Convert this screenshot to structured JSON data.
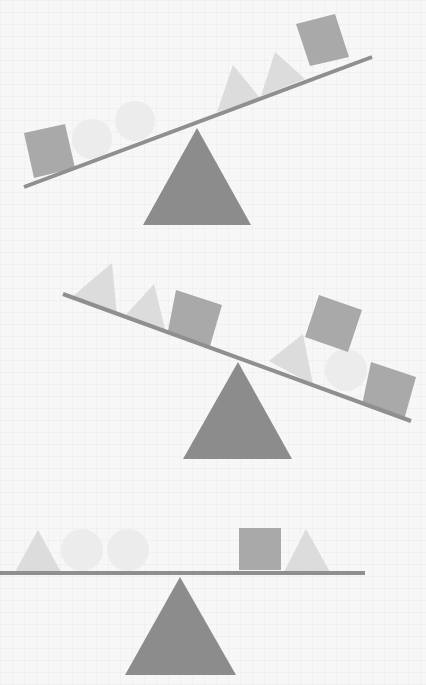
{
  "colors": {
    "background": "#f7f7f7",
    "beam": "#8f8f8f",
    "fulcrum": "#8c8c8c",
    "square": "#a9a9a9",
    "triangle": "#dcdcdc",
    "circle": "#ececec"
  },
  "scales": [
    {
      "name": "scale-1",
      "state": "tilted-left-down",
      "beam": {
        "x1": 24,
        "y1": 187,
        "x2": 372,
        "y2": 57
      },
      "fulcrum": {
        "apex": [
          197,
          128
        ],
        "base_left": [
          143,
          225
        ],
        "base_right": [
          251,
          225
        ]
      },
      "left_items": [
        "square",
        "circle",
        "circle"
      ],
      "right_items": [
        "triangle",
        "triangle",
        "square"
      ]
    },
    {
      "name": "scale-2",
      "state": "tilted-right-down",
      "beam": {
        "x1": 63,
        "y1": 294,
        "x2": 411,
        "y2": 421
      },
      "fulcrum": {
        "apex": [
          238,
          362
        ],
        "base_left": [
          183,
          459
        ],
        "base_right": [
          292,
          459
        ]
      },
      "left_items": [
        "triangle",
        "triangle",
        "square"
      ],
      "right_items": [
        "triangle",
        "circle",
        "square",
        "square (stacked)"
      ]
    },
    {
      "name": "scale-3",
      "state": "balanced",
      "beam": {
        "x1": 0,
        "y1": 573,
        "x2": 365,
        "y2": 573
      },
      "fulcrum": {
        "apex": [
          180,
          577
        ],
        "base_left": [
          125,
          675
        ],
        "base_right": [
          236,
          675
        ]
      },
      "left_items": [
        "triangle",
        "circle",
        "circle"
      ],
      "right_items": [
        "square",
        "triangle"
      ]
    }
  ],
  "shapes": {
    "squares": [
      {
        "scale": 1,
        "points": "24,133 65,124 75,168 34,178"
      },
      {
        "scale": 1,
        "points": "296,24 335,14 349,57 310,66"
      },
      {
        "scale": 2,
        "points": "176,290 222,305 210,346 168,331"
      },
      {
        "scale": 2,
        "points": "319,295 362,310 348,352 305,337"
      },
      {
        "scale": 2,
        "points": "371,362 416,377 404,420 362,405"
      },
      {
        "scale": 3,
        "points": "239,528 281,528 281,570 239,570"
      }
    ],
    "triangles": [
      {
        "scale": 1,
        "points": "217,112 233,65 260,98"
      },
      {
        "scale": 1,
        "points": "261,96 275,52 305,79"
      },
      {
        "scale": 2,
        "points": "73,296 112,263 117,315"
      },
      {
        "scale": 2,
        "points": "123,318 154,284 166,333"
      },
      {
        "scale": 2,
        "points": "269,361 303,334 313,385"
      },
      {
        "scale": 3,
        "points": "15,572 38,530 61,572"
      },
      {
        "scale": 3,
        "points": "284,572 306,529 330,572"
      }
    ],
    "circles": [
      {
        "scale": 1,
        "cx": 92,
        "cy": 139,
        "r": 20
      },
      {
        "scale": 1,
        "cx": 135,
        "cy": 121,
        "r": 20
      },
      {
        "scale": 2,
        "cx": 346,
        "cy": 370,
        "r": 21
      },
      {
        "scale": 3,
        "cx": 82,
        "cy": 550,
        "r": 21
      },
      {
        "scale": 3,
        "cx": 128,
        "cy": 550,
        "r": 21
      }
    ]
  }
}
